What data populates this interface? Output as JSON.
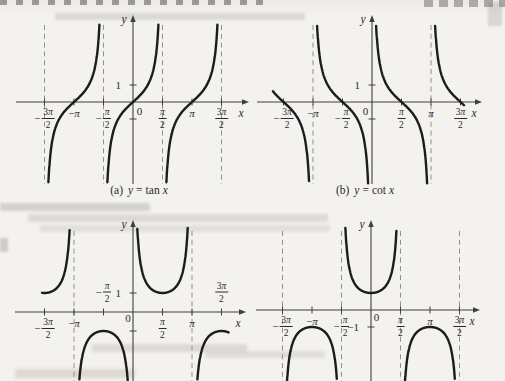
{
  "figure": {
    "colors": {
      "paper": "#f4f2ee",
      "curve": "#1c1c1c",
      "axis": "#3f3f3f",
      "dash": "#909090",
      "text": "#2b2b2b"
    }
  },
  "chart_data": [
    {
      "id": "tan",
      "type": "line",
      "title": "y = tan x",
      "caption": {
        "index": "(a)",
        "lhs": "y",
        "op": "=",
        "fn": "tan",
        "arg": "x"
      },
      "axis_labels": {
        "x": "x",
        "y": "y"
      },
      "x_tick_unit": "π/2",
      "x_ticks": [
        {
          "label": "-3π/2",
          "pi": -1.5
        },
        {
          "label": "-π",
          "pi": -1
        },
        {
          "label": "-π/2",
          "pi": -0.5
        },
        {
          "label": "0",
          "pi": 0,
          "dx": 6.5,
          "dy": 8.5
        },
        {
          "label": "π/2",
          "pi": 0.5
        },
        {
          "label": "π",
          "pi": 1
        },
        {
          "label": "3π/2",
          "pi": 1.5
        }
      ],
      "y_ticks": [
        {
          "label": "1",
          "value": 1
        },
        {
          "label": "",
          "value": -1
        }
      ],
      "asymptotes_pi": [
        -1.5,
        -0.5,
        0.5,
        1.5
      ],
      "branches_pi": [
        [
          -1.5,
          -0.5
        ],
        [
          -0.5,
          0.5
        ],
        [
          0.5,
          1.5
        ]
      ],
      "zeros_pi": [
        -1,
        0,
        1
      ],
      "period": "π",
      "x_range_pi": [
        -1.95,
        1.95
      ],
      "y_visible_range": [
        -4.7,
        4.6
      ],
      "grid": false,
      "legend": false
    },
    {
      "id": "cot",
      "type": "line",
      "title": "y = cot x",
      "caption": {
        "index": "(b)",
        "lhs": "y",
        "op": "=",
        "fn": "cot",
        "arg": "x"
      },
      "axis_labels": {
        "x": "x",
        "y": "y"
      },
      "x_tick_unit": "π/2",
      "x_ticks": [
        {
          "label": "-3π/2",
          "pi": -1.5
        },
        {
          "label": "-π",
          "pi": -1
        },
        {
          "label": "-π/2",
          "pi": -0.5
        },
        {
          "label": "0",
          "pi": 0,
          "dx": -6.5,
          "dy": 9
        },
        {
          "label": "π/2",
          "pi": 0.5
        },
        {
          "label": "π",
          "pi": 1
        },
        {
          "label": "3π/2",
          "pi": 1.5
        }
      ],
      "y_ticks": [
        {
          "label": "1",
          "value": 1
        },
        {
          "label": "",
          "value": -1
        }
      ],
      "asymptotes_pi": [
        -1,
        1
      ],
      "branches_pi": [
        [
          -1.68,
          -1
        ],
        [
          -1,
          0
        ],
        [
          0,
          1
        ],
        [
          1,
          1.56
        ]
      ],
      "zeros_pi": [
        -1.5,
        -0.5,
        0.5,
        1.5
      ],
      "period": "π",
      "x_range_pi": [
        -1.9,
        1.85
      ],
      "y_visible_range": [
        -4.7,
        4.6
      ],
      "grid": false,
      "legend": false
    },
    {
      "id": "csc",
      "type": "line",
      "title": "y = csc x",
      "axis_labels": {
        "x": "x",
        "y": "y"
      },
      "x_tick_unit": "π/2",
      "x_ticks": [
        {
          "label": "-3π/2",
          "pi": -1.5
        },
        {
          "label": "-π",
          "pi": -1
        },
        {
          "label": "-π/2",
          "pi": -0.5,
          "above": true
        },
        {
          "label": "0",
          "pi": 0,
          "dx": -5,
          "dy": 6
        },
        {
          "label": "π/2",
          "pi": 0.5
        },
        {
          "label": "π",
          "pi": 1
        },
        {
          "label": "3π/2",
          "pi": 1.5,
          "above": true
        }
      ],
      "y_ticks": [
        {
          "label": "1",
          "value": 1
        },
        {
          "label": "",
          "value": -1
        }
      ],
      "asymptotes_pi": [
        -1,
        1
      ],
      "branches_pi": [
        [
          -1.54,
          -1
        ],
        [
          -1,
          0
        ],
        [
          0,
          1
        ],
        [
          1,
          1.62
        ]
      ],
      "extrema": [
        {
          "x_pi": -1.5,
          "y": 1
        },
        {
          "x_pi": -0.5,
          "y": -1
        },
        {
          "x_pi": 0.5,
          "y": 1
        },
        {
          "x_pi": 1.5,
          "y": -1
        }
      ],
      "period": "2π",
      "x_range_pi": [
        -1.95,
        1.9
      ],
      "y_visible_range": [
        -3.7,
        4.5
      ],
      "grid": false,
      "legend": false
    },
    {
      "id": "sec",
      "type": "line",
      "title": "y = sec x",
      "axis_labels": {
        "x": "x",
        "y": "y"
      },
      "x_tick_unit": "π/2",
      "x_ticks": [
        {
          "label": "-3π/2",
          "pi": -1.5
        },
        {
          "label": "-π",
          "pi": -1
        },
        {
          "label": "-π/2",
          "pi": -0.5
        },
        {
          "label": "0",
          "pi": 0,
          "dx": 5.5,
          "dy": 6.5
        },
        {
          "label": "π/2",
          "pi": 0.5
        },
        {
          "label": "π",
          "pi": 1
        },
        {
          "label": "3π/2",
          "pi": 1.5
        }
      ],
      "y_ticks": [
        {
          "label": "-1",
          "value": -1
        },
        {
          "label": "",
          "value": 1
        }
      ],
      "asymptotes_pi": [
        -1.5,
        -0.5,
        0.5,
        1.5
      ],
      "branches_pi": [
        [
          -1.5,
          -0.5
        ],
        [
          -0.5,
          0.5
        ],
        [
          0.5,
          1.5
        ]
      ],
      "extrema": [
        {
          "x_pi": -1,
          "y": -1
        },
        {
          "x_pi": 0,
          "y": 1
        },
        {
          "x_pi": 1,
          "y": -1
        }
      ],
      "period": "2π",
      "x_range_pi": [
        -1.95,
        1.85
      ],
      "y_visible_range": [
        -4.2,
        4.9
      ],
      "grid": false,
      "legend": false
    }
  ]
}
